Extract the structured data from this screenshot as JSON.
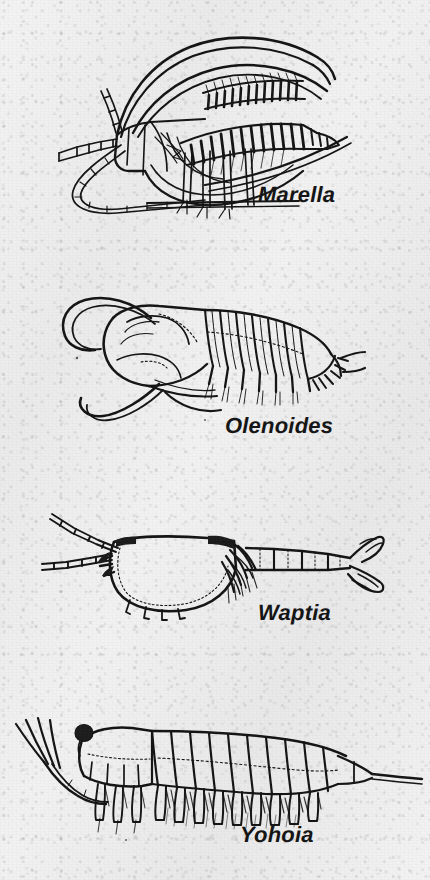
{
  "plate": {
    "title": "Burgess Shale Arthropods",
    "background_color": "#efefef",
    "ink_color": "#111111",
    "width": 430,
    "height": 880,
    "medium": "printed halftone line drawing on textured paper"
  },
  "figures": [
    {
      "id": "marella",
      "label": "Marella",
      "common_name": "lace crab",
      "label_position": {
        "x": 258,
        "y": 182
      },
      "label_font_size": 22,
      "orientation": "three-quarter view, head to left",
      "features": [
        "head shield with two pairs of long curved backswept spines",
        "two pairs of antennae, one segmented and whip-like",
        "series of biramous appendages with feathery gill branches",
        "fine filamentous setae along gill rakers",
        "elongate body tapering to rear"
      ],
      "anatomy_counts": {
        "head_spine_pairs": 2,
        "gill_branch_rows": 2,
        "visible_walking_legs": 6
      }
    },
    {
      "id": "olenoides",
      "label": "Olenoides",
      "common_name": "trilobite",
      "label_position": {
        "x": 225,
        "y": 413
      },
      "label_font_size": 22,
      "orientation": "oblique lateral view, head to left",
      "features": [
        "broad semicircular cephalon with glabella",
        "seven thoracic segments with pleural spines",
        "pygidium with marginal spines",
        "long multi-segmented antennae curving forward",
        "posterior cerci projecting behind pygidium",
        "biramous legs with gill filaments beneath body"
      ],
      "anatomy_counts": {
        "thoracic_segments": 7,
        "pygidial_spines": 6,
        "antennae": 2,
        "cerci": 2
      }
    },
    {
      "id": "waptia",
      "label": "Waptia",
      "common_name": "bivalved arthropod",
      "label_position": {
        "x": 258,
        "y": 600
      },
      "label_font_size": 22,
      "orientation": "lateral view, head to left",
      "features": [
        "large bivalved carapace covering head and front of thorax",
        "pair of long slender antennae projecting forward",
        "segmented abdomen of about five segments",
        "tail fan of paddle-shaped lamellae at rear",
        "row of feathery swimming appendages below carapace",
        "short spiny limbs beneath the carapace margin"
      ],
      "anatomy_counts": {
        "abdominal_segments": 5,
        "tail_fan_lobes": 4,
        "antennae": 2
      }
    },
    {
      "id": "yohoia",
      "label": "Yohoia",
      "common_name": "great-appendage arthropod",
      "label_position": {
        "x": 240,
        "y": 822
      },
      "label_font_size": 22,
      "orientation": "lateral view, head to left",
      "features": [
        "dark rounded eye at front of head",
        "pair of great appendages with four terminal spines",
        "ten trunk segments each bearing a flap-like limb",
        "feathery gill lamellae beneath trunk limbs",
        "three limbless posterior segments",
        "long tapering telson spine at rear"
      ],
      "anatomy_counts": {
        "trunk_segments": 10,
        "limb_bearing_segments": 10,
        "great_appendage_spines": 4,
        "eyes": 1
      }
    }
  ]
}
